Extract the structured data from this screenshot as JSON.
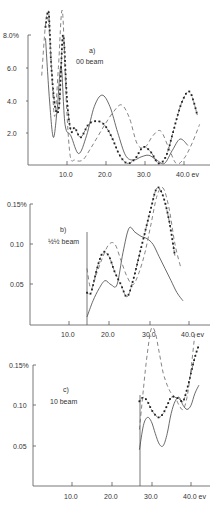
{
  "chart_data": [
    {
      "type": "line",
      "panel": "a)",
      "title": "00 beam",
      "xlabel": "ev",
      "ylabel": "%",
      "x_ticks": [
        "10.0",
        "20.0",
        "30.0",
        "40.0"
      ],
      "y_ticks": [
        "2.0",
        "4.0",
        "6.0",
        "8.0%"
      ],
      "xlim": [
        0,
        45
      ],
      "ylim": [
        0,
        8.0
      ],
      "series": [
        {
          "name": "solid",
          "style": "solid",
          "x": [
            4.5,
            5.5,
            6.5,
            7.5,
            8.5,
            9.5,
            11,
            13,
            15,
            17,
            19,
            21,
            23,
            25,
            27,
            29,
            31,
            33,
            35,
            37,
            39,
            41
          ],
          "y": [
            7.8,
            4.0,
            1.7,
            3.5,
            6.1,
            2.5,
            1.8,
            0.7,
            1.8,
            3.6,
            4.3,
            3.6,
            2.0,
            0.6,
            0.3,
            0.5,
            0.6,
            0.3,
            0.1,
            0.9,
            1.6,
            1.2
          ]
        },
        {
          "name": "dotted",
          "style": "dotted-with-markers",
          "x": [
            4.5,
            5.3,
            6.0,
            7.0,
            8.0,
            9.0,
            10.0,
            11.0,
            12.0,
            13.5,
            15.5,
            17.5,
            19.5,
            21.5,
            23.5,
            25.5,
            27.5,
            29.5,
            31.5,
            33.5,
            35.5,
            37.5,
            39.5,
            41.5,
            43.5
          ],
          "y": [
            8.5,
            9.4,
            6.0,
            3.5,
            3.7,
            8.0,
            4.0,
            2.1,
            2.3,
            1.7,
            2.5,
            2.7,
            2.5,
            1.7,
            0.6,
            0.1,
            0.4,
            1.1,
            0.8,
            0.1,
            0.6,
            2.3,
            3.9,
            4.5,
            3.0
          ]
        },
        {
          "name": "dashed",
          "style": "dashed",
          "x": [
            3.5,
            4.8,
            5.8,
            6.8,
            7.8,
            8.8,
            9.8,
            10.8,
            12,
            14,
            16,
            18,
            20,
            22,
            24,
            26,
            28,
            30,
            32,
            34,
            36,
            38,
            40,
            42,
            44
          ],
          "y": [
            5.5,
            9.2,
            7.0,
            3.0,
            6.0,
            9.5,
            4.0,
            0.6,
            0.3,
            0.3,
            1.0,
            1.8,
            2.6,
            3.3,
            3.7,
            2.9,
            1.3,
            1.1,
            1.8,
            2.1,
            1.1,
            0.1,
            0.4,
            1.3,
            2.5
          ]
        }
      ]
    },
    {
      "type": "line",
      "panel": "b)",
      "title": "½½ beam",
      "xlabel": "ev",
      "ylabel": "%",
      "x_ticks": [
        "10.0",
        "20.0",
        "30.0",
        "40.0"
      ],
      "y_ticks": [
        "0.05",
        "0.10",
        "0.15%"
      ],
      "xlim": [
        0,
        45
      ],
      "ylim": [
        0,
        0.15
      ],
      "threshold_ev": 14.5,
      "series": [
        {
          "name": "solid",
          "style": "solid",
          "x": [
            14.5,
            16,
            17.5,
            19,
            20.5,
            22,
            23.5,
            25,
            26.5,
            28,
            29.5,
            31,
            32.5,
            34,
            35.5,
            37,
            38.5
          ],
          "y": [
            0.01,
            0.03,
            0.045,
            0.055,
            0.05,
            0.05,
            0.09,
            0.12,
            0.115,
            0.11,
            0.107,
            0.1,
            0.085,
            0.07,
            0.055,
            0.04,
            0.03
          ]
        },
        {
          "name": "dotted",
          "style": "dotted-with-markers",
          "x": [
            14.5,
            15.5,
            17,
            18.5,
            20,
            21.5,
            23,
            24.5,
            26,
            27.5,
            29,
            30.5,
            32,
            33.5,
            35,
            36.5
          ],
          "y": [
            0.04,
            0.04,
            0.07,
            0.09,
            0.085,
            0.065,
            0.05,
            0.035,
            0.055,
            0.085,
            0.115,
            0.145,
            0.17,
            0.16,
            0.13,
            0.085
          ]
        },
        {
          "name": "dashed",
          "style": "dashed",
          "x": [
            14.5,
            15.5,
            17,
            18.5,
            20,
            21.5,
            23,
            24.5,
            26,
            27.5,
            29,
            30.5,
            32,
            33.5,
            35,
            36.5,
            38
          ],
          "y": [
            0.07,
            0.045,
            0.065,
            0.085,
            0.1,
            0.1,
            0.08,
            0.06,
            0.05,
            0.065,
            0.09,
            0.125,
            0.16,
            0.17,
            0.145,
            0.1,
            0.07
          ]
        }
      ]
    },
    {
      "type": "line",
      "panel": "c)",
      "title": "10 beam",
      "xlabel": "ev",
      "ylabel": "%",
      "x_ticks": [
        "10.0",
        "20.0",
        "30.0",
        "40.0"
      ],
      "y_ticks": [
        "0.05",
        "0.10",
        "0.15%"
      ],
      "xlim": [
        0,
        45
      ],
      "ylim": [
        0,
        0.15
      ],
      "threshold_ev": 27,
      "series": [
        {
          "name": "solid",
          "style": "solid",
          "x": [
            27,
            28,
            29,
            30,
            31,
            32,
            33,
            34,
            35,
            36,
            37,
            38,
            39,
            40,
            41,
            42
          ],
          "y": [
            0.045,
            0.075,
            0.085,
            0.08,
            0.065,
            0.052,
            0.05,
            0.065,
            0.09,
            0.105,
            0.11,
            0.1,
            0.095,
            0.1,
            0.115,
            0.125
          ]
        },
        {
          "name": "dotted",
          "style": "dotted-with-markers",
          "x": [
            27,
            28,
            29,
            30,
            31,
            32,
            33,
            34,
            35,
            36,
            37,
            38,
            39,
            40,
            41,
            42
          ],
          "y": [
            0.105,
            0.11,
            0.105,
            0.095,
            0.088,
            0.085,
            0.09,
            0.1,
            0.11,
            0.11,
            0.108,
            0.105,
            0.12,
            0.14,
            0.16,
            0.175
          ]
        },
        {
          "name": "dashed",
          "style": "dashed",
          "x": [
            27,
            28,
            29,
            30,
            31,
            32,
            33,
            34,
            35,
            36,
            37,
            38,
            39,
            40,
            41
          ],
          "y": [
            0.07,
            0.12,
            0.165,
            0.195,
            0.19,
            0.165,
            0.14,
            0.125,
            0.115,
            0.11,
            0.1,
            0.095,
            0.11,
            0.145,
            0.19
          ]
        }
      ]
    }
  ],
  "panels": [
    {
      "label": "a)",
      "beam": "00 beam",
      "y_unit_top": "8.0%",
      "y_ticks": [
        "6.0",
        "4.0",
        "2.0"
      ],
      "x_ticks": [
        "10.0",
        "20.0",
        "30.0",
        "40.0 ev"
      ]
    },
    {
      "label": "b)",
      "beam": "½½ beam",
      "y_unit_top": "0.15%",
      "y_ticks": [
        "0.10",
        "0.05"
      ],
      "x_ticks": [
        "10.0",
        "20.0",
        "30.0",
        "40.0 ev"
      ]
    },
    {
      "label": "c)",
      "beam": "10 beam",
      "y_unit_top": "0.15%",
      "y_ticks": [
        "0.10",
        "0.05"
      ],
      "x_ticks": [
        "10.0",
        "20.0",
        "30.0",
        "40.0 ev"
      ]
    }
  ]
}
